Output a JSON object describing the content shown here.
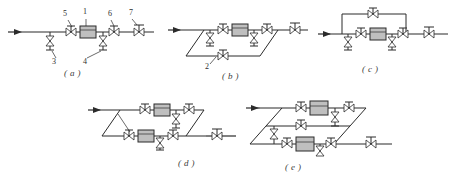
{
  "page": {
    "background": "#ffffff",
    "ink": "#2b2b2b",
    "meter_fill": "#bfbfbf"
  },
  "figures": [
    {
      "id": "a",
      "caption": "( a )",
      "description": "Straight in-line run: inlet arrow, two drain/blow-off valves below the main pipe, two gate valves, one meter body and one outlet valve",
      "callouts": [
        {
          "label": "5",
          "x": 63,
          "y": 14
        },
        {
          "label": "1",
          "x": 80,
          "y": 12
        },
        {
          "label": "6",
          "x": 104,
          "y": 14
        },
        {
          "label": "7",
          "x": 125,
          "y": 13
        },
        {
          "label": "3",
          "x": 51,
          "y": 57
        },
        {
          "label": "4",
          "x": 81,
          "y": 57
        }
      ]
    },
    {
      "id": "b",
      "caption": "( b )",
      "description": "Single parallelogram bypass loop below the main line with a bypass valve, two drain valves and a meter on the upper run",
      "callouts": [
        {
          "label": "2",
          "x": 213,
          "y": 60
        }
      ]
    },
    {
      "id": "c",
      "caption": "( c )",
      "description": "Rectangular bypass loop above the main line with a bypass valve, meter and two drain valves on the lower run",
      "callouts": []
    },
    {
      "id": "d",
      "caption": "( d )",
      "description": "Two-branch parallelogram arrangement with a meter on each of the upper and lower runs and drain valves",
      "callouts": []
    },
    {
      "id": "e",
      "caption": "( e )",
      "description": "Three-run parallelogram arrangement with meters on the upper and lower runs and a plain bypass on the middle run",
      "callouts": []
    }
  ],
  "legend": {
    "items": [
      {
        "key": "1",
        "name": "meter"
      },
      {
        "key": "2",
        "name": "bypass-line"
      },
      {
        "key": "3",
        "name": "drain-valve"
      },
      {
        "key": "4",
        "name": "drain-valve"
      },
      {
        "key": "5",
        "name": "gate-valve"
      },
      {
        "key": "6",
        "name": "gate-valve"
      },
      {
        "key": "7",
        "name": "outlet-valve"
      }
    ]
  },
  "icons": {
    "flow_arrow": "flow-arrow-icon",
    "gate_valve": "gate-valve-icon",
    "drain_valve": "drain-valve-icon",
    "meter": "meter-icon"
  }
}
